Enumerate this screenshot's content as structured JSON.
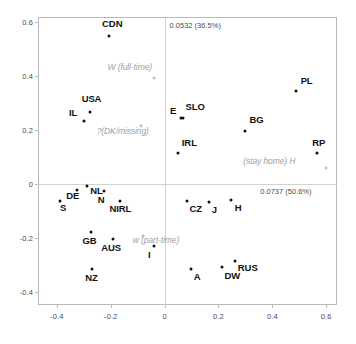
{
  "chart_data": {
    "type": "scatter",
    "title": "",
    "subtitle": "",
    "xlabel": "",
    "ylabel": "",
    "xlim": [
      -0.47,
      0.64
    ],
    "ylim": [
      -0.45,
      0.62
    ],
    "xticks": [
      "-0.4",
      "-0.2",
      "0",
      "0.2",
      "0.4",
      "0.6"
    ],
    "xtick_values": [
      -0.4,
      -0.2,
      0,
      0.2,
      0.4,
      0.6
    ],
    "yticks": [
      "0.6",
      "0.4",
      "0.2",
      "0",
      "-0.2",
      "-0.4"
    ],
    "ytick_values": [
      0.6,
      0.4,
      0.2,
      0,
      -0.2,
      -0.4
    ],
    "grid": false,
    "legend": "none",
    "annotations": {
      "dim2_inertia": "0.0532 (36.5%)",
      "dim1_inertia": "0.0737 (50.6%)"
    },
    "points": [
      {
        "label": "CDN",
        "x": -0.205,
        "y": 0.548,
        "lx": -0.232,
        "ly": 0.592
      },
      {
        "label": "USA",
        "x": -0.278,
        "y": 0.266,
        "lx": -0.308,
        "ly": 0.31
      },
      {
        "label": "IL",
        "x": -0.3,
        "y": 0.233,
        "lx": -0.355,
        "ly": 0.258
      },
      {
        "label": "E",
        "x": 0.062,
        "y": 0.243,
        "lx": 0.02,
        "ly": 0.268
      },
      {
        "label": "SLO",
        "x": 0.068,
        "y": 0.246,
        "lx": 0.078,
        "ly": 0.283
      },
      {
        "label": "PL",
        "x": 0.487,
        "y": 0.345,
        "lx": 0.505,
        "ly": 0.378
      },
      {
        "label": "BG",
        "x": 0.3,
        "y": 0.198,
        "lx": 0.315,
        "ly": 0.232
      },
      {
        "label": "IRL",
        "x": 0.05,
        "y": 0.113,
        "lx": 0.064,
        "ly": 0.15
      },
      {
        "label": "RP",
        "x": 0.567,
        "y": 0.113,
        "lx": 0.548,
        "ly": 0.15
      },
      {
        "label": "DE",
        "x": -0.327,
        "y": -0.022,
        "lx": -0.365,
        "ly": -0.05
      },
      {
        "label": "NL",
        "x": -0.288,
        "y": -0.008,
        "lx": -0.276,
        "ly": -0.03
      },
      {
        "label": "N",
        "x": -0.225,
        "y": -0.027,
        "lx": -0.248,
        "ly": -0.062
      },
      {
        "label": "S",
        "x": -0.39,
        "y": -0.065,
        "lx": -0.388,
        "ly": -0.095
      },
      {
        "label": "NIRL",
        "x": -0.165,
        "y": -0.062,
        "lx": -0.205,
        "ly": -0.098
      },
      {
        "label": "CZ",
        "x": 0.082,
        "y": -0.062,
        "lx": 0.092,
        "ly": -0.098
      },
      {
        "label": "J",
        "x": 0.163,
        "y": -0.068,
        "lx": 0.175,
        "ly": -0.1
      },
      {
        "label": "H",
        "x": 0.248,
        "y": -0.06,
        "lx": 0.26,
        "ly": -0.095
      },
      {
        "label": "GB",
        "x": -0.272,
        "y": -0.18,
        "lx": -0.305,
        "ly": -0.215
      },
      {
        "label": "AUS",
        "x": -0.192,
        "y": -0.203,
        "lx": -0.235,
        "ly": -0.242
      },
      {
        "label": "I",
        "x": -0.04,
        "y": -0.232,
        "lx": -0.062,
        "ly": -0.268
      },
      {
        "label": "RUS",
        "x": 0.262,
        "y": -0.285,
        "lx": 0.272,
        "ly": -0.318
      },
      {
        "label": "DW",
        "x": 0.212,
        "y": -0.31,
        "lx": 0.222,
        "ly": -0.345
      },
      {
        "label": "A",
        "x": 0.098,
        "y": -0.315,
        "lx": 0.108,
        "ly": -0.348
      },
      {
        "label": "NZ",
        "x": -0.268,
        "y": -0.318,
        "lx": -0.295,
        "ly": -0.355
      }
    ],
    "supplementary_points": [
      {
        "label": "W (full-time)",
        "x": -0.04,
        "y": 0.392,
        "lx": -0.212,
        "ly": 0.432,
        "align": "left"
      },
      {
        "label": "?(DK/missing)",
        "x": -0.086,
        "y": 0.215,
        "lx": -0.252,
        "ly": 0.192,
        "align": "left"
      },
      {
        "label": "w (part-time)",
        "x": -0.082,
        "y": -0.192,
        "lx": -0.118,
        "ly": -0.212,
        "align": "left"
      },
      {
        "label": "(stay home) H",
        "x": 0.6,
        "y": 0.058,
        "lx": 0.292,
        "ly": 0.082,
        "align": "left"
      }
    ]
  }
}
